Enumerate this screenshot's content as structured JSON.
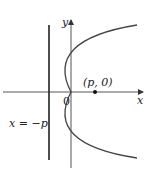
{
  "diagram": {
    "labels": {
      "y_axis": "y",
      "x_axis": "x",
      "origin": "0",
      "focus": "(p, 0)",
      "directrix": "x = −p"
    },
    "colors": {
      "axes": "#555555",
      "curve": "#333333",
      "directrix": "#222222",
      "text": "#222222"
    }
  }
}
